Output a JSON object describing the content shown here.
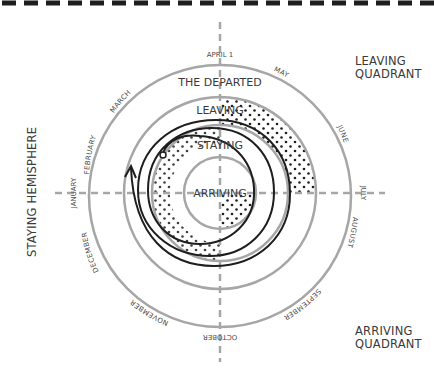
{
  "colors": {
    "ring": "#a6a6a6",
    "axis": "#a6a6a6",
    "spiral": "#1e1e1e",
    "dots": "#1e1e1e",
    "text": "#3a3a3a",
    "border": "#1e1e1e",
    "background": "#ffffff"
  },
  "labels": {
    "leaving_quadrant_line1": "LEAVING",
    "leaving_quadrant_line2": "QUADRANT",
    "arriving_quadrant_line1": "ARRIVING",
    "arriving_quadrant_line2": "QUADRANT",
    "staying_hemisphere": "STAYING HEMISPHERE"
  },
  "rings": {
    "departed": "THE DEPARTED",
    "leaving": "LEAVING",
    "staying": "STAYING",
    "arriving": "ARRIVING"
  },
  "months": {
    "january": "JANUARY",
    "february": "FEBRUARY",
    "march": "MARCH",
    "april": "APRIL 1",
    "may": "MAY",
    "june": "JUNE",
    "july": "JULY",
    "august": "AUGUST",
    "september": "SEPTEMBER",
    "october": "OCTOBER",
    "november": "NOVEMBER",
    "december": "DECEMBER"
  }
}
